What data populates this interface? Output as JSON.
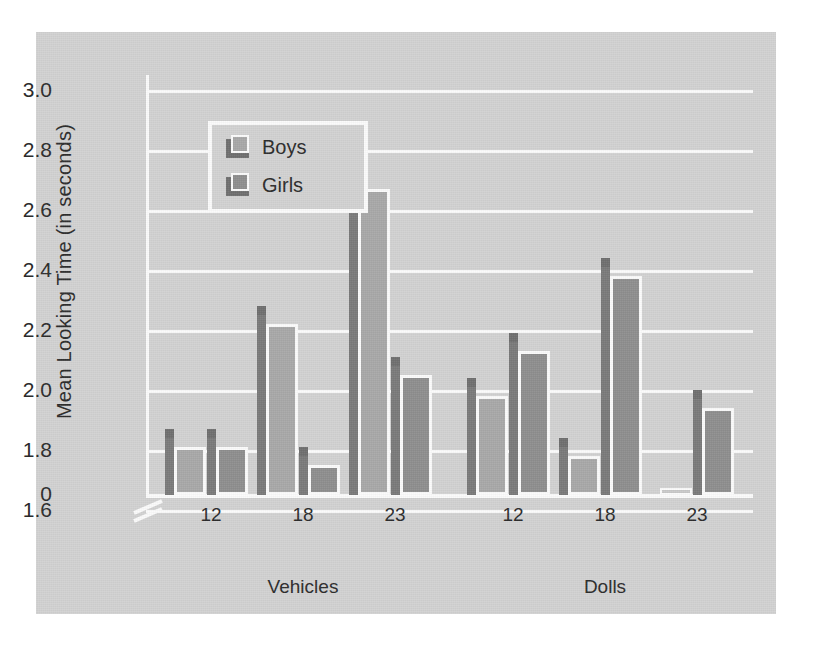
{
  "chart_data": {
    "type": "bar",
    "title": "",
    "xlabel": "Age in months",
    "ylabel": "Mean Looking Time (in seconds)",
    "ylim": [
      0,
      3.0
    ],
    "y_axis_break": true,
    "y_break_from": 0,
    "y_break_to": 1.6,
    "grid": true,
    "legend_position": "top-left inside plot",
    "yticks": [
      "3.0",
      "2.8",
      "2.6",
      "2.4",
      "2.2",
      "2.0",
      "1.8",
      "1.6",
      "0"
    ],
    "ytick_values": [
      3.0,
      2.8,
      2.6,
      2.4,
      2.2,
      2.0,
      1.8,
      1.6,
      0
    ],
    "legend": [
      "Boys",
      "Girls"
    ],
    "series_colors": {
      "Boys": "#a8a8a8",
      "Girls": "#8e8e8e"
    },
    "panels": [
      {
        "name": "Vehicles",
        "xlabel": "Age in months",
        "categories": [
          "12",
          "18",
          "23"
        ],
        "series": [
          {
            "name": "Boys",
            "values": [
              1.53,
              2.22,
              2.67
            ]
          },
          {
            "name": "Girls",
            "values": [
              1.53,
              1.75,
              2.05
            ]
          }
        ]
      },
      {
        "name": "Dolls",
        "xlabel": "Age in months",
        "categories": [
          "12",
          "18",
          "23"
        ],
        "series": [
          {
            "name": "Boys",
            "values": [
              1.98,
              1.78,
              0.0
            ]
          },
          {
            "name": "Girls",
            "values": [
              2.13,
              2.38,
              1.94
            ]
          }
        ]
      }
    ]
  },
  "axis": {
    "y_title": "Mean Looking Time (in seconds)",
    "ticks": [
      {
        "label": "3.0",
        "value": 3.0
      },
      {
        "label": "2.8",
        "value": 2.8
      },
      {
        "label": "2.6",
        "value": 2.6
      },
      {
        "label": "2.4",
        "value": 2.4
      },
      {
        "label": "2.2",
        "value": 2.2
      },
      {
        "label": "2.0",
        "value": 2.0
      },
      {
        "label": "1.8",
        "value": 1.8
      },
      {
        "label": "1.6",
        "value": 1.6
      },
      {
        "label": "0",
        "value": 0.0
      }
    ]
  },
  "legend": {
    "items": [
      {
        "label": "Boys",
        "color": "#a8a8a8"
      },
      {
        "label": "Girls",
        "color": "#8e8e8e"
      }
    ]
  },
  "panels": [
    {
      "name": "Vehicles",
      "axis_label": "Age in months",
      "ticks": [
        "12",
        "18",
        "23"
      ]
    },
    {
      "name": "Dolls",
      "axis_label": "Age in months",
      "ticks": [
        "12",
        "18",
        "23"
      ]
    }
  ],
  "colors": {
    "panel_background": "#d2d2d2",
    "gridline": "#fbfbfb",
    "text": "#2b2b2b",
    "boys": "#a8a8a8",
    "girls": "#8e8e8e",
    "shadow": "#7a7a7a"
  }
}
